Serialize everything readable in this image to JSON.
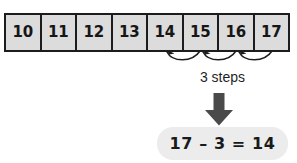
{
  "diagram": {
    "numberline": {
      "name": "number-line-strip",
      "cells": [
        {
          "label": "10"
        },
        {
          "label": "11"
        },
        {
          "label": "12"
        },
        {
          "label": "13"
        },
        {
          "label": "14"
        },
        {
          "label": "15"
        },
        {
          "label": "16"
        },
        {
          "label": "17"
        }
      ],
      "fill_color": "#dcdcdc",
      "border_color": "#1c1c1c"
    },
    "hops": {
      "name": "count-back-hops",
      "count": 3,
      "direction": "left",
      "from_value": "17",
      "to_value": "14",
      "stroke_color": "#1c1c1c",
      "arrow_icon": "curved-arrow-left-icon"
    },
    "steps_caption": {
      "text": "3 steps"
    },
    "down_arrow": {
      "icon": "arrow-down-icon",
      "color": "#4a4a4a"
    },
    "result": {
      "equation": "17 – 3 = 14",
      "minuend": "17",
      "subtrahend": "3",
      "difference": "14",
      "pill_color": "#ececec"
    }
  }
}
